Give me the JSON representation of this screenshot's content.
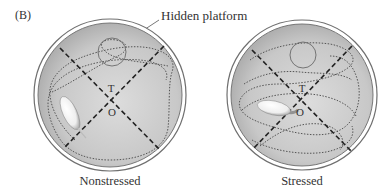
{
  "figure": {
    "panel_label": "(B)",
    "callout_label": "Hidden platform",
    "colors": {
      "pool_fill": "#c4c4c4",
      "pool_light": "#dedede",
      "rim": "#7a7a7a",
      "quadrant_lines": "#222222",
      "swim_path": "#555555",
      "platform_outline": "#6a6a6a"
    },
    "pools": [
      {
        "name": "nonstressed",
        "caption": "Nonstressed",
        "target_quadrant_label": "T",
        "opposite_quadrant_label": "O"
      },
      {
        "name": "stressed",
        "caption": "Stressed",
        "target_quadrant_label": "T",
        "opposite_quadrant_label": "O"
      }
    ]
  }
}
